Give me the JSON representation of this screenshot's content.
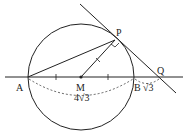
{
  "diagram": {
    "type": "geometry",
    "points": {
      "A": {
        "label": "A",
        "x": 28,
        "y": 77
      },
      "B": {
        "label": "B",
        "x": 134,
        "y": 77
      },
      "M": {
        "label": "M",
        "x": 81,
        "y": 77
      },
      "P": {
        "label": "P",
        "x": 115,
        "y": 40
      },
      "Q": {
        "label": "Q",
        "x": 160,
        "y": 77
      }
    },
    "circle": {
      "center": "M",
      "radius": 53
    },
    "labels": {
      "AB_length": "4√3",
      "BQ_length": "√3",
      "right_angle_at": "P"
    },
    "colors": {
      "stroke": "#222222",
      "background": "#ffffff"
    }
  }
}
